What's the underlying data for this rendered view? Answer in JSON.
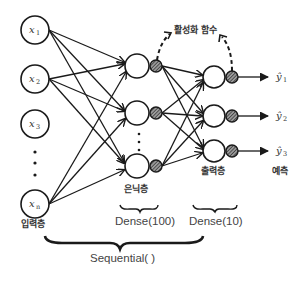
{
  "diagram": {
    "type": "neural-network",
    "input_layer": {
      "label": "입력층",
      "nodes": [
        {
          "var": "x",
          "sub": "1"
        },
        {
          "var": "x",
          "sub": "2"
        },
        {
          "var": "x",
          "sub": "3"
        },
        {
          "var": "x",
          "sub": "n"
        }
      ]
    },
    "hidden_layer": {
      "label": "은닉층",
      "keras": "Dense(100)"
    },
    "output_layer": {
      "label": "출력층",
      "keras": "Dense(10)"
    },
    "activation_label": "활성화 함수",
    "predictions": {
      "label": "예측",
      "items": [
        {
          "var": "ŷ",
          "sub": "1"
        },
        {
          "var": "ŷ",
          "sub": "2"
        },
        {
          "var": "ŷ",
          "sub": "3"
        }
      ]
    },
    "model_label": "Sequential( )"
  }
}
